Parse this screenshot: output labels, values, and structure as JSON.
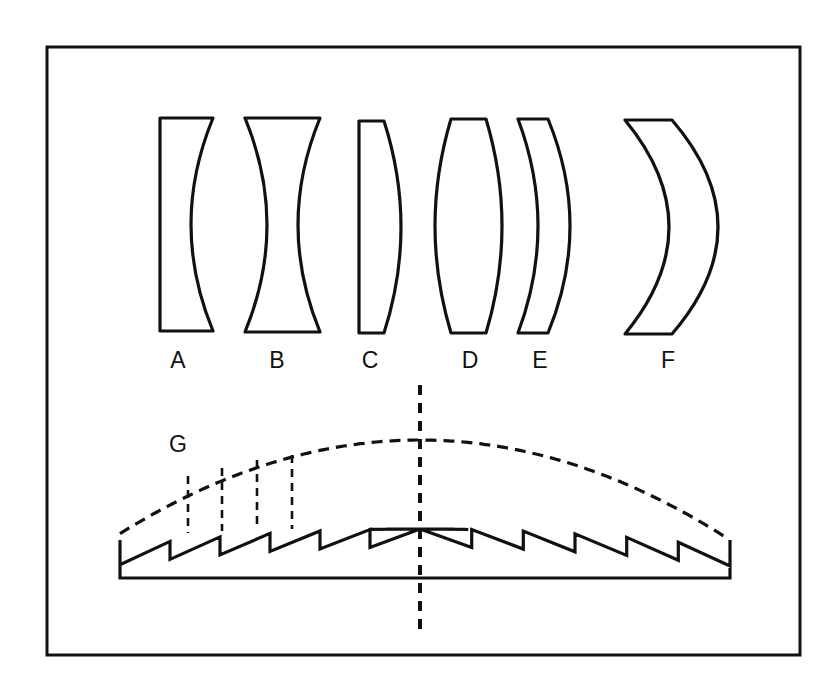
{
  "figure": {
    "width": 819,
    "height": 691,
    "background_color": "#ffffff",
    "ink_color": "#111111",
    "border": {
      "x": 47,
      "y": 47,
      "width": 753,
      "height": 608,
      "stroke_width": 3
    }
  },
  "lenses": [
    {
      "label": "A",
      "name": "plano-concave",
      "label_x": 178,
      "label_y": 368,
      "left_x": 160,
      "right_x": 213,
      "top_y": 118,
      "bottom_y": 331,
      "left_curve": 0,
      "right_curve": -22
    },
    {
      "label": "B",
      "name": "biconcave",
      "label_x": 277,
      "label_y": 368,
      "left_x": 245,
      "right_x": 320,
      "top_y": 118,
      "bottom_y": 332,
      "left_curve": 22,
      "right_curve": -22
    },
    {
      "label": "C",
      "name": "plano-convex",
      "label_x": 370,
      "label_y": 368,
      "left_x": 359,
      "right_x": 384,
      "top_y": 121,
      "bottom_y": 333,
      "left_curve": 0,
      "right_curve": 17
    },
    {
      "label": "D",
      "name": "biconvex",
      "label_x": 470,
      "label_y": 368,
      "left_x": 451,
      "right_x": 486,
      "top_y": 119,
      "bottom_y": 333,
      "left_curve": -16,
      "right_curve": 16
    },
    {
      "label": "E",
      "name": "positive-meniscus",
      "label_x": 540,
      "label_y": 368,
      "left_x": 518,
      "right_x": 548,
      "top_y": 119,
      "bottom_y": 333,
      "left_curve": 20,
      "right_curve": 22
    },
    {
      "label": "F",
      "name": "deep-meniscus",
      "label_x": 668,
      "label_y": 368,
      "left_x": 625,
      "right_x": 672,
      "top_y": 120,
      "bottom_y": 334,
      "left_curve": 44,
      "right_curve": 46
    }
  ],
  "fresnel": {
    "label": "G",
    "label_x": 178,
    "label_y": 452,
    "left_x": 120,
    "right_x": 730,
    "center_x": 420,
    "base_y": 578,
    "shoulder_y": 540,
    "arc_apex_y": 440,
    "arc_edge_y": 540,
    "profile_apex_y": 529,
    "profile_edge_y": 548,
    "groove_count_per_side": 6,
    "groove_depth": 18,
    "axis": {
      "top_y": 385,
      "bottom_y": 637
    },
    "dashed_risers": [
      {
        "x": 188,
        "top_y": 476,
        "bottom_y": 533
      },
      {
        "x": 222,
        "top_y": 468,
        "bottom_y": 531
      },
      {
        "x": 257,
        "top_y": 460,
        "bottom_y": 530
      },
      {
        "x": 292,
        "top_y": 455,
        "bottom_y": 529
      }
    ]
  }
}
